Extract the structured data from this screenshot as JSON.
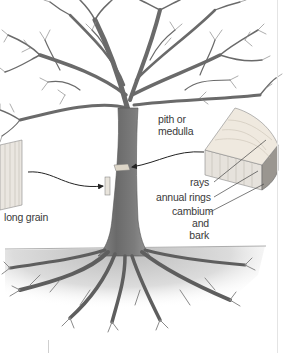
{
  "diagram": {
    "labels": {
      "pith": "pith or",
      "pith_line2": "medulla",
      "rays": "rays",
      "annual_rings": "annual rings",
      "cambium": "cambium",
      "cambium_line2": "and bark",
      "long_grain": "long grain"
    },
    "colors": {
      "ink": "#5a5a5a",
      "trunk": "#6e6e6e",
      "soil": "#d6d6d6",
      "wood_light": "#e6e2dc",
      "text": "#3a3a3a"
    }
  }
}
